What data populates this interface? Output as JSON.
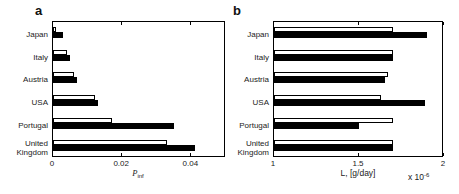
{
  "figure": {
    "width": 459,
    "height": 194,
    "background": "#ffffff"
  },
  "panels": [
    {
      "letter": "a",
      "xlabel_main": "P",
      "xlabel_sub": "inf",
      "xtick_labels": [
        "0",
        "0.02",
        "0.04"
      ]
    },
    {
      "letter": "b",
      "xlabel": "L, [g/day]",
      "multiplier_base": "x 10",
      "multiplier_exp": "-6",
      "xtick_labels": [
        "1",
        "1.5",
        "2"
      ]
    }
  ],
  "chart_data": [
    {
      "type": "bar",
      "orientation": "horizontal",
      "panel": "a",
      "title": "",
      "xlabel": "P_inf",
      "categories": [
        "Japan",
        "Italy",
        "Austria",
        "USA",
        "Portugal",
        "United Kingdom"
      ],
      "series": [
        {
          "name": "open",
          "color": "#ffffff",
          "values": [
            0.001,
            0.004,
            0.006,
            0.012,
            0.017,
            0.033
          ]
        },
        {
          "name": "filled",
          "color": "#000000",
          "values": [
            0.003,
            0.005,
            0.007,
            0.013,
            0.035,
            0.041
          ]
        }
      ],
      "xlim": [
        0,
        0.05
      ],
      "xticks": [
        0,
        0.02,
        0.04
      ],
      "grid": false,
      "legend": "none"
    },
    {
      "type": "bar",
      "orientation": "horizontal",
      "panel": "b",
      "title": "",
      "xlabel": "L, [g/day] x 10^-6",
      "categories": [
        "Japan",
        "Italy",
        "Austria",
        "USA",
        "Portugal",
        "United Kingdom"
      ],
      "series": [
        {
          "name": "open",
          "color": "#ffffff",
          "values": [
            1.7,
            1.7,
            1.67,
            1.63,
            1.7,
            1.7
          ]
        },
        {
          "name": "filled",
          "color": "#000000",
          "values": [
            1.9,
            1.7,
            1.65,
            1.89,
            1.5,
            1.7
          ]
        }
      ],
      "xlim": [
        1,
        2
      ],
      "xticks": [
        1,
        1.5,
        2
      ],
      "grid": false,
      "legend": "none"
    }
  ]
}
